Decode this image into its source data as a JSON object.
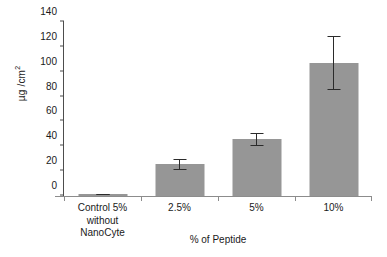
{
  "chart_data": {
    "type": "bar",
    "title": "",
    "subtitle": "",
    "xlabel": "% of Peptide",
    "ylabel": "µg /cm²",
    "categories": [
      "Control 5% without NanoCyte",
      "2.5%",
      "5%",
      "10%"
    ],
    "category_lines": [
      [
        "Control 5%",
        "without",
        "NanoCyte"
      ],
      [
        "2.5%"
      ],
      [
        "5%"
      ],
      [
        "10%"
      ]
    ],
    "values": [
      1.5,
      25.5,
      45.5,
      107
    ],
    "errors": [
      0.5,
      4.5,
      5,
      22
    ],
    "series": [
      {
        "name": "µg /cm²",
        "values": [
          1.5,
          25.5,
          45.5,
          107
        ],
        "errors": [
          0.5,
          4.5,
          5,
          22
        ]
      }
    ],
    "ylim": [
      0,
      140
    ],
    "yticks": [
      0,
      20,
      40,
      60,
      80,
      100,
      120,
      140
    ],
    "ytick_labels": [
      "0",
      "20",
      "40",
      "60",
      "80",
      "100",
      "120",
      "140"
    ],
    "grid": false,
    "legend": false,
    "legend_position": "none",
    "bar_color": "#969696",
    "error_color": "#2b2b2b",
    "axis_color": "#4d4d4d",
    "background": "#ffffff"
  },
  "axis": {
    "y_label_main": "µg /cm",
    "y_label_sup": "2"
  }
}
